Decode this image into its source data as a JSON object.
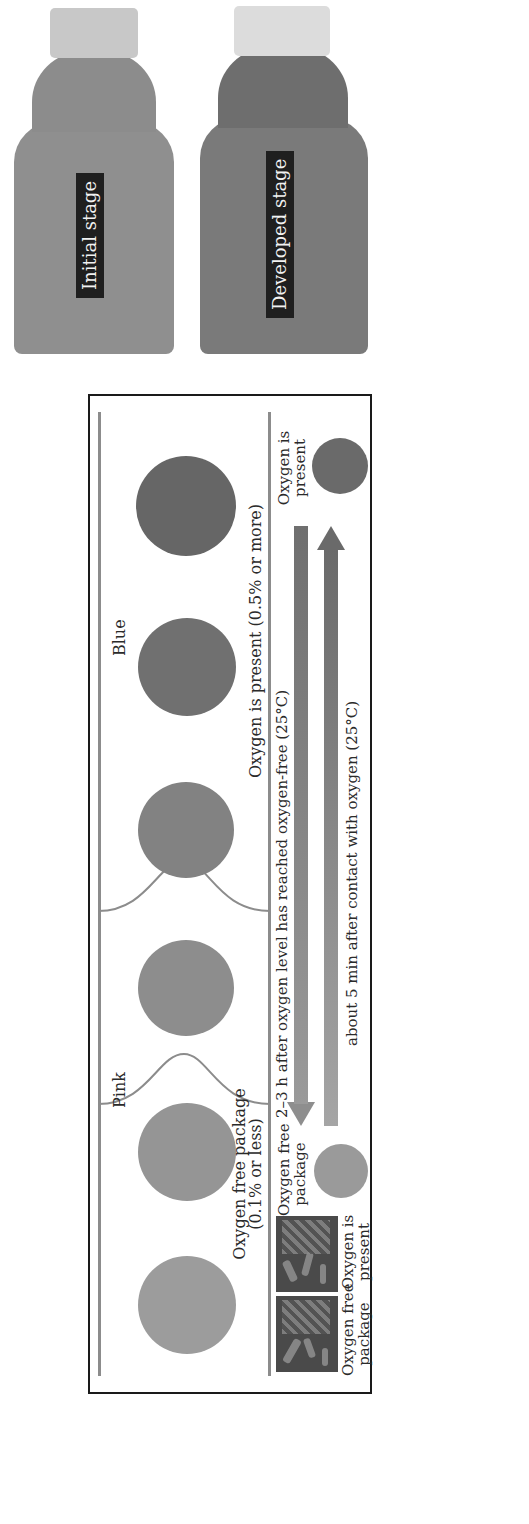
{
  "diagram": {
    "header_labels": {
      "pink": "Pink",
      "blue": "Blue"
    },
    "swatches": [
      {
        "position": 1,
        "color": "#9c9c9c",
        "state": "pink"
      },
      {
        "position": 2,
        "color": "#959595",
        "state": "pink"
      },
      {
        "position": 3,
        "color": "#8d8d8d",
        "state": "transition"
      },
      {
        "position": 4,
        "color": "#828282",
        "state": "transition"
      },
      {
        "position": 5,
        "color": "#707070",
        "state": "blue"
      },
      {
        "position": 6,
        "color": "#666666",
        "state": "blue"
      }
    ],
    "range_labels": {
      "oxygen_free": "Oxygen free package",
      "oxygen_free_sub": "(0.1% or less)",
      "oxygen_present": "Oxygen is present (0.5% or more)"
    },
    "packages": {
      "left_caption_line1": "Oxygen free",
      "left_caption_line2": "package",
      "right_caption_line1": "Oxygen is",
      "right_caption_line2": "present"
    },
    "cycle": {
      "start_label_line1": "Oxygen free",
      "start_label_line2": "package",
      "end_label_line1": "Oxygen is",
      "end_label_line2": "present",
      "start_color": "#9a9a9a",
      "end_color": "#6a6a6a",
      "forward_arrow_text": "2–3 h after oxygen level has reached oxygen-free (25°C)",
      "reverse_arrow_text": "about 5 min after contact with oxygen (25°C)"
    }
  },
  "photo": {
    "bottles": [
      {
        "label": "Initial stage",
        "body_color": "#8f8f8f",
        "cap_color": "#c8c8c8"
      },
      {
        "label": "Developed stage",
        "body_color": "#7a7a7a",
        "cap_color": "#dcdcdc"
      }
    ]
  }
}
